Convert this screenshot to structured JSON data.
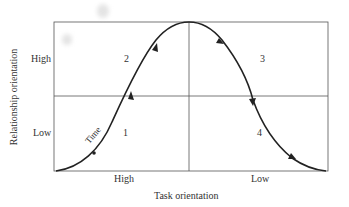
{
  "diagram": {
    "y_axis_label": "Relationship orientation",
    "x_axis_label": "Task orientation",
    "y_ticks": [
      "High",
      "Low"
    ],
    "x_ticks": [
      "High",
      "Low"
    ],
    "quadrants": [
      {
        "id": "1",
        "label": "1",
        "position": "bottom-left"
      },
      {
        "id": "2",
        "label": "2",
        "position": "top-left"
      },
      {
        "id": "3",
        "label": "3",
        "position": "top-right"
      },
      {
        "id": "4",
        "label": "4",
        "position": "bottom-right"
      }
    ],
    "curve_label": "Time",
    "curve": "bell-shaped curve rising from bottom-left through quadrants 1 and 2, peaking at center-top, descending through quadrants 3 and 4 to bottom-right, with direction arrows",
    "colors": {
      "line": "#222222",
      "text": "#333333",
      "background": "#ffffff"
    }
  }
}
